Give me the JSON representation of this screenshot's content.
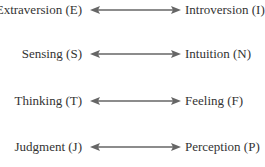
{
  "diagram": {
    "pairs": [
      {
        "left": "Extraversion (E)",
        "right": "Introversion (I)"
      },
      {
        "left": "Sensing (S)",
        "right": "Intuition (N)"
      },
      {
        "left": "Thinking (T)",
        "right": "Feeling (F)"
      },
      {
        "left": "Judgment (J)",
        "right": "Perception (P)"
      }
    ],
    "arrow_color": "#666666",
    "text_color": "#333333"
  }
}
